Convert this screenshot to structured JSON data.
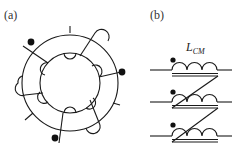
{
  "figure": {
    "panels": [
      {
        "id": "a",
        "label": "(a)",
        "description": "Toroidal core with three windings, each marked with a polarity dot"
      },
      {
        "id": "b",
        "label": "(b)",
        "description": "Three-winding common-mode choke schematic"
      }
    ],
    "inductor_label": {
      "main": "L",
      "subscript": "CM"
    },
    "colors": {
      "line": "#1a1a1a",
      "background": "#ffffff"
    },
    "icons": [
      "polarity-dot-icon",
      "toroid-core-icon",
      "inductor-coil-icon",
      "core-double-line-icon"
    ]
  }
}
